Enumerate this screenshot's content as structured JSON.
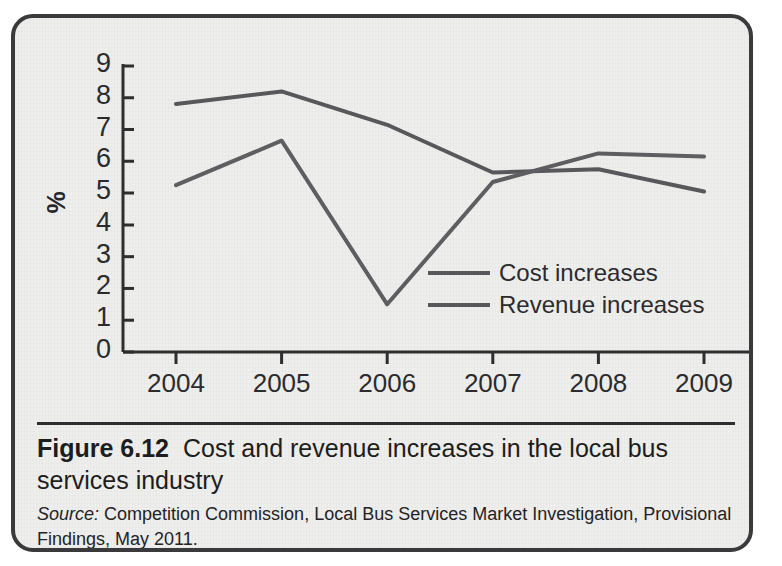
{
  "figure": {
    "number": "Figure 6.12",
    "title": "Cost and revenue increases in the local bus services industry",
    "source_label": "Source:",
    "source_text": "Competition Commission, Local Bus Services Market Investigation, Provisional Findings, May 2011."
  },
  "colors": {
    "card_background": "#eeeeec",
    "card_border": "#3a3a3c",
    "axis": "#2e2e31",
    "series_cost": "#58585c",
    "series_revenue": "#5e5e62",
    "text": "#1d1d20"
  },
  "chart_data": {
    "type": "line",
    "title": "",
    "xlabel": "",
    "ylabel": "%",
    "categories": [
      "2004",
      "2005",
      "2006",
      "2007",
      "2008",
      "2009"
    ],
    "yticks": [
      "0",
      "1",
      "2",
      "3",
      "4",
      "5",
      "6",
      "7",
      "8",
      "9"
    ],
    "ylim": [
      0,
      9
    ],
    "grid": false,
    "legend_position": "inside-lower-right",
    "series": [
      {
        "name": "Cost increases",
        "values": [
          7.8,
          8.2,
          7.15,
          5.65,
          5.75,
          5.05
        ]
      },
      {
        "name": "Revenue increases",
        "values": [
          5.25,
          6.65,
          1.5,
          5.35,
          6.25,
          6.15
        ]
      }
    ]
  }
}
